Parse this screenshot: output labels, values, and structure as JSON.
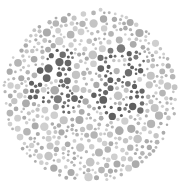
{
  "plate": {
    "title": "Ishihara color test plate",
    "hidden_number": "48",
    "colors": {
      "background_dots": [
        "#c4c4c4",
        "#b5b5b5",
        "#cfcfcf",
        "#ababab"
      ],
      "figure_dots": [
        "#6e6e6e",
        "#5f5f5f",
        "#7b7b7b",
        "#666666"
      ],
      "page": "#ffffff"
    }
  }
}
